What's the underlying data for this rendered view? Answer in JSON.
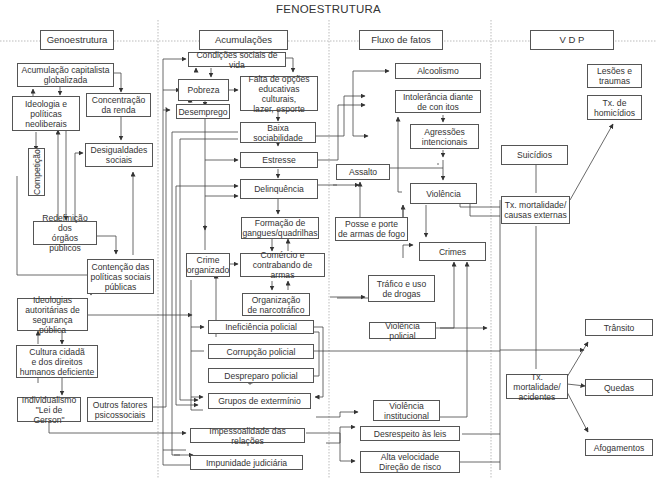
{
  "title": "FENOESTRUTURA",
  "columns": [
    {
      "id": "genoestrutura",
      "label": "Genoestrutura"
    },
    {
      "id": "acumulacoes",
      "label": "Acumulações"
    },
    {
      "id": "fluxo",
      "label": "Fluxo de fatos"
    },
    {
      "id": "vdp",
      "label": "V D P"
    }
  ],
  "nodes": {
    "acumulacao_capitalista": "Acumulação capitalista\nglobalizada",
    "ideologia_politicas": "Ideologia e\npolíticas\nneoliberais",
    "concentracao_renda": "Concentração\nda renda",
    "competicao": "Competição",
    "desigualdades": "Desigualdades\nsociais",
    "redefinicao_orgaos": "Redefinição dos\nórgãos públicos",
    "contencao_politicas": "Contenção das\npolíticas sociais\npúblicas",
    "ideologias_autoritarias": "Ideologias\nautoritárias de\nsegurança pública",
    "cultura_cidada": "Cultura cidadã\ne dos direitos\nhumanos deficiente",
    "individualismo": "Individualismo\n\"Lei de Gerson\"",
    "outros_fatores": "Outros fatores\npsicossociais",
    "condicoes_sociais": "Condições sociais de vida",
    "pobreza": "Pobreza",
    "falta_opcoes": "Falta de opções\neducativas culturais,\nlazer, esporte",
    "desemprego": "Desemprego",
    "baixa_sociabilidade": "Baixa sociabilidade",
    "estresse": "Estresse",
    "delinquencia": "Delinquência",
    "formacao_gangues": "Formação de\ngangues/quadrilhas",
    "crime_organizado": "Crime\norganizado",
    "comercio_armas": "Comércio e\ncontrabando de armas",
    "narcotrafico": "Organização\nde narcotráfico",
    "ineficiencia_policial": "Ineficiência policial",
    "corrupcao_policial": "Corrupção policial",
    "despreparo_policial": "Despreparo policial",
    "grupos_exterminio": "Grupos de extermínio",
    "impessoalidade": "Impessoalidade das relações",
    "impunidade": "Impunidade judiciária",
    "alcoolismo": "Alcoolismo",
    "intolerancia": "Intolerância diante\nde con  itos",
    "agressoes": "Agressões\nintencionais",
    "assalto": "Assalto",
    "violencia": "Violência",
    "posse_armas": "Posse e porte\nde armas de fogo",
    "crimes": "Crimes",
    "trafico_drogas": "Tráfico e uso\nde drogas",
    "violencia_policial": "Violência policial",
    "violencia_institucional": "Violência\ninstitucional",
    "desrespeito_leis": "Desrespeito às leis",
    "alta_velocidade": "Alta velocidade\nDireção de risco",
    "lesoes_traumas": "Lesões e\ntraumas",
    "tx_homicidios": "Tx. de\nhomicídios",
    "suicidios": "Suicídios",
    "tx_mortalidade_externas": "Tx. mortalidade/\ncausas externas",
    "transito": "Trânsito",
    "tx_mortalidade_acidentes": "Tx. mortalidade/\nacidentes",
    "quedas": "Quedas",
    "afogamentos": "Afogamentos"
  },
  "colors": {
    "line": "#444444",
    "border": "#555555",
    "dotted": "#aaaaaa",
    "text": "#333333"
  }
}
